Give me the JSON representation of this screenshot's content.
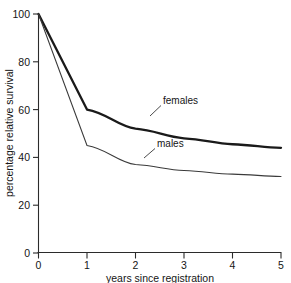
{
  "chart_data": {
    "type": "line",
    "title": "",
    "subtitle": "",
    "xlabel": "years since registration",
    "ylabel": "percentage relative survival",
    "xlim": [
      0,
      5
    ],
    "ylim": [
      0,
      100
    ],
    "grid": false,
    "legend_position": "inline-annotations",
    "x_ticks": [
      0,
      1,
      2,
      3,
      4,
      5
    ],
    "x_tick_labels": [
      "0",
      "1",
      "2",
      "3",
      "4",
      "5"
    ],
    "y_ticks": [
      0,
      20,
      40,
      60,
      80,
      100
    ],
    "y_tick_labels": [
      "0",
      "20",
      "40",
      "60",
      "80",
      "100"
    ],
    "x": [
      0,
      1,
      2,
      3,
      4,
      5
    ],
    "series": [
      {
        "name": "females",
        "values": [
          100,
          60,
          52,
          48,
          45.5,
          44
        ],
        "annotation": "females",
        "style": "thick"
      },
      {
        "name": "males",
        "values": [
          100,
          45,
          37,
          34.5,
          33,
          32
        ],
        "annotation": "males",
        "style": "thin"
      }
    ],
    "annotations": [
      {
        "text": "females",
        "series": "females"
      },
      {
        "text": "males",
        "series": "males"
      }
    ]
  },
  "colors": {
    "females_line": "#1a1a1a",
    "males_line": "#3a3a3a",
    "axis": "#2b2b2b",
    "text": "#151515",
    "background": "#ffffff"
  }
}
